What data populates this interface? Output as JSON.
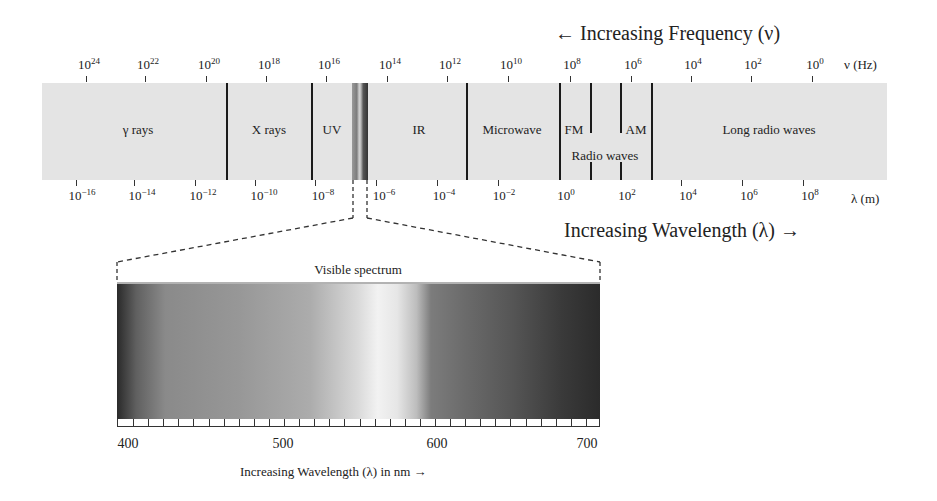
{
  "diagram": {
    "title_frequency": "← Increasing Frequency (ν)",
    "title_wavelength": "Increasing Wavelength (λ) →",
    "frequency_axis": {
      "unit": "ν (Hz)",
      "ticks": [
        {
          "base": "10",
          "exp": "24"
        },
        {
          "base": "10",
          "exp": "22"
        },
        {
          "base": "10",
          "exp": "20"
        },
        {
          "base": "10",
          "exp": "18"
        },
        {
          "base": "10",
          "exp": "16"
        },
        {
          "base": "10",
          "exp": "14"
        },
        {
          "base": "10",
          "exp": "12"
        },
        {
          "base": "10",
          "exp": "10"
        },
        {
          "base": "10",
          "exp": "8"
        },
        {
          "base": "10",
          "exp": "6"
        },
        {
          "base": "10",
          "exp": "4"
        },
        {
          "base": "10",
          "exp": "2"
        },
        {
          "base": "10",
          "exp": "0"
        }
      ]
    },
    "wavelength_axis": {
      "unit": "λ (m)",
      "ticks": [
        {
          "base": "10",
          "exp": "−16"
        },
        {
          "base": "10",
          "exp": "−14"
        },
        {
          "base": "10",
          "exp": "−12"
        },
        {
          "base": "10",
          "exp": "−10"
        },
        {
          "base": "10",
          "exp": "−8"
        },
        {
          "base": "10",
          "exp": "−6"
        },
        {
          "base": "10",
          "exp": "−4"
        },
        {
          "base": "10",
          "exp": "−2"
        },
        {
          "base": "10",
          "exp": "0"
        },
        {
          "base": "10",
          "exp": "2"
        },
        {
          "base": "10",
          "exp": "4"
        },
        {
          "base": "10",
          "exp": "6"
        },
        {
          "base": "10",
          "exp": "8"
        }
      ]
    },
    "regions": [
      {
        "label": "γ rays"
      },
      {
        "label": "X rays"
      },
      {
        "label": "UV"
      },
      {
        "label": "IR"
      },
      {
        "label": "Microwave"
      },
      {
        "label": "FM"
      },
      {
        "label": "AM"
      },
      {
        "label": "Radio waves"
      },
      {
        "label": "Long radio waves"
      }
    ],
    "visible": {
      "title": "Visible spectrum",
      "nm_labels": [
        "400",
        "500",
        "600",
        "700"
      ],
      "caption": "Increasing Wavelength (λ) in nm →"
    }
  }
}
